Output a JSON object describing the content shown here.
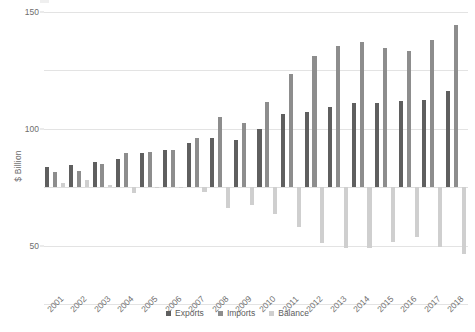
{
  "chart_data": {
    "type": "bar",
    "title": "",
    "xlabel": "",
    "ylabel": "$ Billion",
    "ylim": [
      -100,
      150
    ],
    "yticks": [
      150,
      100,
      50,
      0,
      -50,
      -100
    ],
    "ytick_labels": [
      "150",
      "100",
      "50",
      "0",
      "-50",
      "-100"
    ],
    "grid": true,
    "legend_position": "bottom-center",
    "categories": [
      "2001",
      "2002",
      "2003",
      "2004",
      "2005",
      "2006",
      "2007",
      "2008",
      "2009",
      "2010",
      "2011",
      "2012",
      "2013",
      "2014",
      "2015",
      "2016",
      "2017",
      "2018"
    ],
    "series": [
      {
        "name": "Exports",
        "color": "#5f5f5f",
        "values": [
          17,
          19,
          22,
          24,
          29,
          32,
          38,
          42,
          40,
          50,
          63,
          64,
          69,
          72,
          72,
          74,
          75,
          82
        ]
      },
      {
        "name": "Imports",
        "color": "#8d8d8d",
        "values": [
          13,
          14,
          20,
          29,
          30,
          32,
          42,
          60,
          55,
          73,
          97,
          112,
          121,
          124,
          119,
          117,
          126,
          139
        ]
      },
      {
        "name": "Balance",
        "color": "#cfcfcf",
        "values": [
          4,
          6,
          2,
          -5,
          -1,
          0,
          -4,
          -18,
          -15,
          -23,
          -34,
          -48,
          -52,
          -52,
          -47,
          -43,
          -51,
          -57
        ]
      }
    ]
  },
  "legend": {
    "items": [
      {
        "label": "Exports",
        "swatch": "exports-swatch"
      },
      {
        "label": "Imports",
        "swatch": "imports-swatch"
      },
      {
        "label": "Balance",
        "swatch": "balance-swatch"
      }
    ]
  }
}
